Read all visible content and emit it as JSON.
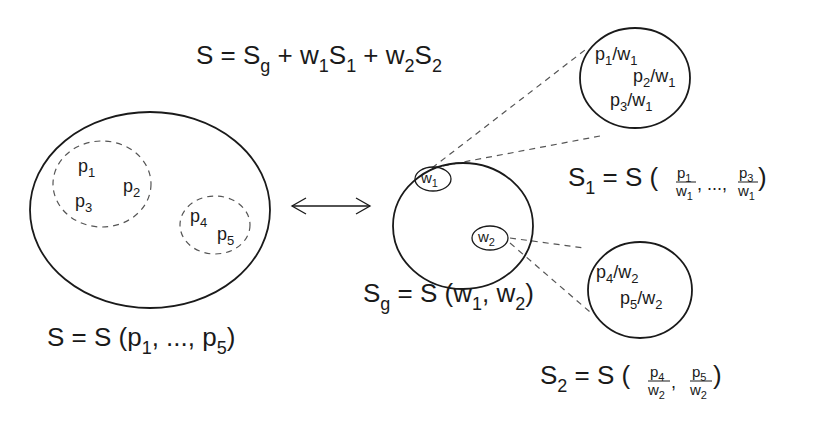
{
  "diagram": {
    "type": "set-decomposition",
    "colors": {
      "stroke": "#1a1a1a",
      "dash": "#555555",
      "background": "#ffffff"
    },
    "top_equation": {
      "parts": [
        "S",
        " = ",
        "S",
        "g",
        " + ",
        "w",
        "1",
        "S",
        "1",
        " + ",
        "w",
        "2",
        "S",
        "2"
      ],
      "text": "S = Sg + w1S1 + w2S2"
    },
    "left_set": {
      "caption": {
        "main": "S = S (p",
        "s1": "1",
        "mid": ", ..., p",
        "s5": "5",
        "end": ")"
      },
      "group1": [
        {
          "base": "p",
          "sub": "1"
        },
        {
          "base": "p",
          "sub": "2"
        },
        {
          "base": "p",
          "sub": "3"
        }
      ],
      "group2": [
        {
          "base": "p",
          "sub": "4"
        },
        {
          "base": "p",
          "sub": "5"
        }
      ]
    },
    "arrow": {
      "name": "bidirectional-arrow",
      "glyph": "⟷"
    },
    "global_set": {
      "nodes": [
        {
          "base": "w",
          "sub": "1"
        },
        {
          "base": "w",
          "sub": "2"
        }
      ],
      "caption": {
        "s": "S",
        "g": "g",
        "mid": " = S (w",
        "s1": "1",
        "comma": ", w",
        "s2": "2",
        "end": ")"
      }
    },
    "sub_set_1": {
      "items": [
        {
          "p": "p",
          "ps": "1",
          "slash": "/w",
          "ws": "1"
        },
        {
          "p": "p",
          "ps": "2",
          "slash": "/w",
          "ws": "1"
        },
        {
          "p": "p",
          "ps": "3",
          "slash": "/w",
          "ws": "1"
        }
      ],
      "equation": {
        "lhs": "S",
        "lhs_sub": "1",
        "eq": " = S (",
        "f1_num": "p",
        "f1_num_sub": "1",
        "f1_den": "w",
        "f1_den_sub": "1",
        "sep": ", ...,",
        "f2_num": "p",
        "f2_num_sub": "3",
        "f2_den": "w",
        "f2_den_sub": "1",
        "close": ")"
      }
    },
    "sub_set_2": {
      "items": [
        {
          "p": "p",
          "ps": "4",
          "slash": "/w",
          "ws": "2"
        },
        {
          "p": "p",
          "ps": "5",
          "slash": "/w",
          "ws": "2"
        }
      ],
      "equation": {
        "lhs": "S",
        "lhs_sub": "2",
        "eq": " = S (",
        "f1_num": "p",
        "f1_num_sub": "4",
        "f1_den": "w",
        "f1_den_sub": "2",
        "sep": ",",
        "f2_num": "p",
        "f2_num_sub": "5",
        "f2_den": "w",
        "f2_den_sub": "2",
        "close": ")"
      }
    }
  }
}
